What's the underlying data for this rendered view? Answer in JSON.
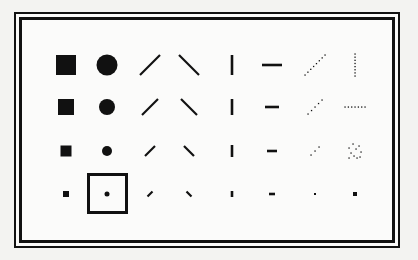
{
  "dialog": {
    "type": "brush-shape-palette",
    "rows": 4,
    "columns": 8,
    "selected": {
      "row": 3,
      "col": 1
    },
    "ink_color": "#111111",
    "background_color": "#fbfbfa"
  },
  "brushes": [
    [
      {
        "name": "square-brush-large",
        "shape": "square",
        "size": 20
      },
      {
        "name": "round-brush-large",
        "shape": "circle",
        "size": 21
      },
      {
        "name": "slash-brush-large",
        "shape": "slash",
        "size": 20
      },
      {
        "name": "backslash-brush-large",
        "shape": "backslash",
        "size": 20
      },
      {
        "name": "vertical-brush-large",
        "shape": "vertical",
        "size": 20
      },
      {
        "name": "horizontal-brush-large",
        "shape": "horizontal",
        "size": 20
      },
      {
        "name": "dotted-slash-brush-large",
        "shape": "dotted-slash",
        "size": 20
      },
      {
        "name": "dotted-vertical-brush-large",
        "shape": "dotted-vertical",
        "size": 22
      }
    ],
    [
      {
        "name": "square-brush-medium",
        "shape": "square",
        "size": 16
      },
      {
        "name": "round-brush-medium",
        "shape": "circle",
        "size": 16
      },
      {
        "name": "slash-brush-medium",
        "shape": "slash",
        "size": 16
      },
      {
        "name": "backslash-brush-medium",
        "shape": "backslash",
        "size": 16
      },
      {
        "name": "vertical-brush-medium",
        "shape": "vertical",
        "size": 16
      },
      {
        "name": "horizontal-brush-medium",
        "shape": "horizontal",
        "size": 14
      },
      {
        "name": "dotted-slash-brush-medium",
        "shape": "dotted-slash",
        "size": 14
      },
      {
        "name": "dotted-horizontal-brush-medium",
        "shape": "dotted-horizontal",
        "size": 20
      }
    ],
    [
      {
        "name": "square-brush-small",
        "shape": "square",
        "size": 11
      },
      {
        "name": "round-brush-small",
        "shape": "circle",
        "size": 10
      },
      {
        "name": "slash-brush-small",
        "shape": "slash",
        "size": 10
      },
      {
        "name": "backslash-brush-small",
        "shape": "backslash",
        "size": 10
      },
      {
        "name": "vertical-brush-small",
        "shape": "vertical",
        "size": 12
      },
      {
        "name": "horizontal-brush-small",
        "shape": "horizontal",
        "size": 10
      },
      {
        "name": "dotted-slash-brush-small",
        "shape": "dotted-slash",
        "size": 8
      },
      {
        "name": "spray-brush",
        "shape": "spray",
        "size": 16
      }
    ],
    [
      {
        "name": "square-brush-tiny",
        "shape": "square",
        "size": 6
      },
      {
        "name": "round-brush-tiny",
        "shape": "circle",
        "size": 5
      },
      {
        "name": "slash-brush-tiny",
        "shape": "slash",
        "size": 5
      },
      {
        "name": "backslash-brush-tiny",
        "shape": "backslash",
        "size": 5
      },
      {
        "name": "vertical-brush-tiny",
        "shape": "vertical",
        "size": 6
      },
      {
        "name": "horizontal-brush-tiny",
        "shape": "horizontal",
        "size": 6
      },
      {
        "name": "dot-brush-tiny",
        "shape": "dot",
        "size": 2
      },
      {
        "name": "dot-brush-small",
        "shape": "dot",
        "size": 4
      }
    ]
  ]
}
